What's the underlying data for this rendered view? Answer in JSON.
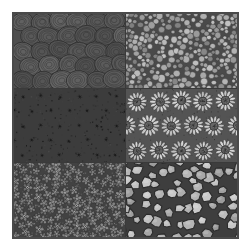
{
  "figure": {
    "background_color": "#ffffff",
    "frame_color": "#4a4a4a",
    "grid_columns": 2,
    "grid_rows": 3,
    "margin_px": 12,
    "grid_size_px": 227
  },
  "textures": [
    {
      "id": "texture-1",
      "position": "top-left",
      "name": "concentric-swirl-blobs",
      "description": "Dense field of dark rounded blobs each filled with concentric swirl contour lines, resembling cabbages or brain coral",
      "background_color": "#4f4f4f",
      "shape_fill": "#5a5a5a",
      "line_color": "#303030",
      "mean_brightness": 0.33,
      "contrast": "low",
      "element_scale": "large",
      "element_count": 30
    },
    {
      "id": "texture-2",
      "position": "top-right",
      "name": "packed-pebbles",
      "description": "Densely packed round pebbles of varying light-gray tones on dark interstitial background",
      "background_color": "#4a4a4a",
      "shape_fill": "#9a9a9a",
      "line_color": "#2e2e2e",
      "mean_brightness": 0.55,
      "contrast": "medium",
      "element_scale": "small",
      "element_count": 260
    },
    {
      "id": "texture-3",
      "position": "middle-left",
      "name": "white-heart-petal-flowers",
      "description": "High-contrast bright white heart-shaped petals clustered into four-petal flowers over a dark speckled ground",
      "background_color": "#3c3c3c",
      "shape_fill": "#f2f2f2",
      "line_color": "#1a1a1a",
      "mean_brightness": 0.62,
      "contrast": "high",
      "element_scale": "medium",
      "element_count": 54
    },
    {
      "id": "texture-4",
      "position": "middle-right",
      "name": "radiating-sunflowers",
      "description": "Sunflower or daisy motifs with radiating pale petals around stippled mid-gray disc centers",
      "background_color": "#545454",
      "shape_fill": "#c8c8c8",
      "line_color": "#2a2a2a",
      "mean_brightness": 0.52,
      "contrast": "medium-high",
      "element_scale": "large",
      "element_count": 15
    },
    {
      "id": "texture-5",
      "position": "bottom-left",
      "name": "small-petal-flowers",
      "description": "Small five-petal flowers with bright ring centers scattered over a dark mottled ground",
      "background_color": "#424242",
      "shape_fill": "#787878",
      "line_color": "#242424",
      "mean_brightness": 0.38,
      "contrast": "medium",
      "element_scale": "small",
      "element_count": 120
    },
    {
      "id": "texture-6",
      "position": "bottom-right",
      "name": "cobblestone-polygons",
      "description": "Large irregular polygonal cobblestones in light gray separated by dark mortar seams",
      "background_color": "#3e3e3e",
      "shape_fill": "#b0b0b0",
      "line_color": "#2b2b2b",
      "mean_brightness": 0.58,
      "contrast": "medium",
      "element_scale": "large",
      "element_count": 70
    }
  ]
}
